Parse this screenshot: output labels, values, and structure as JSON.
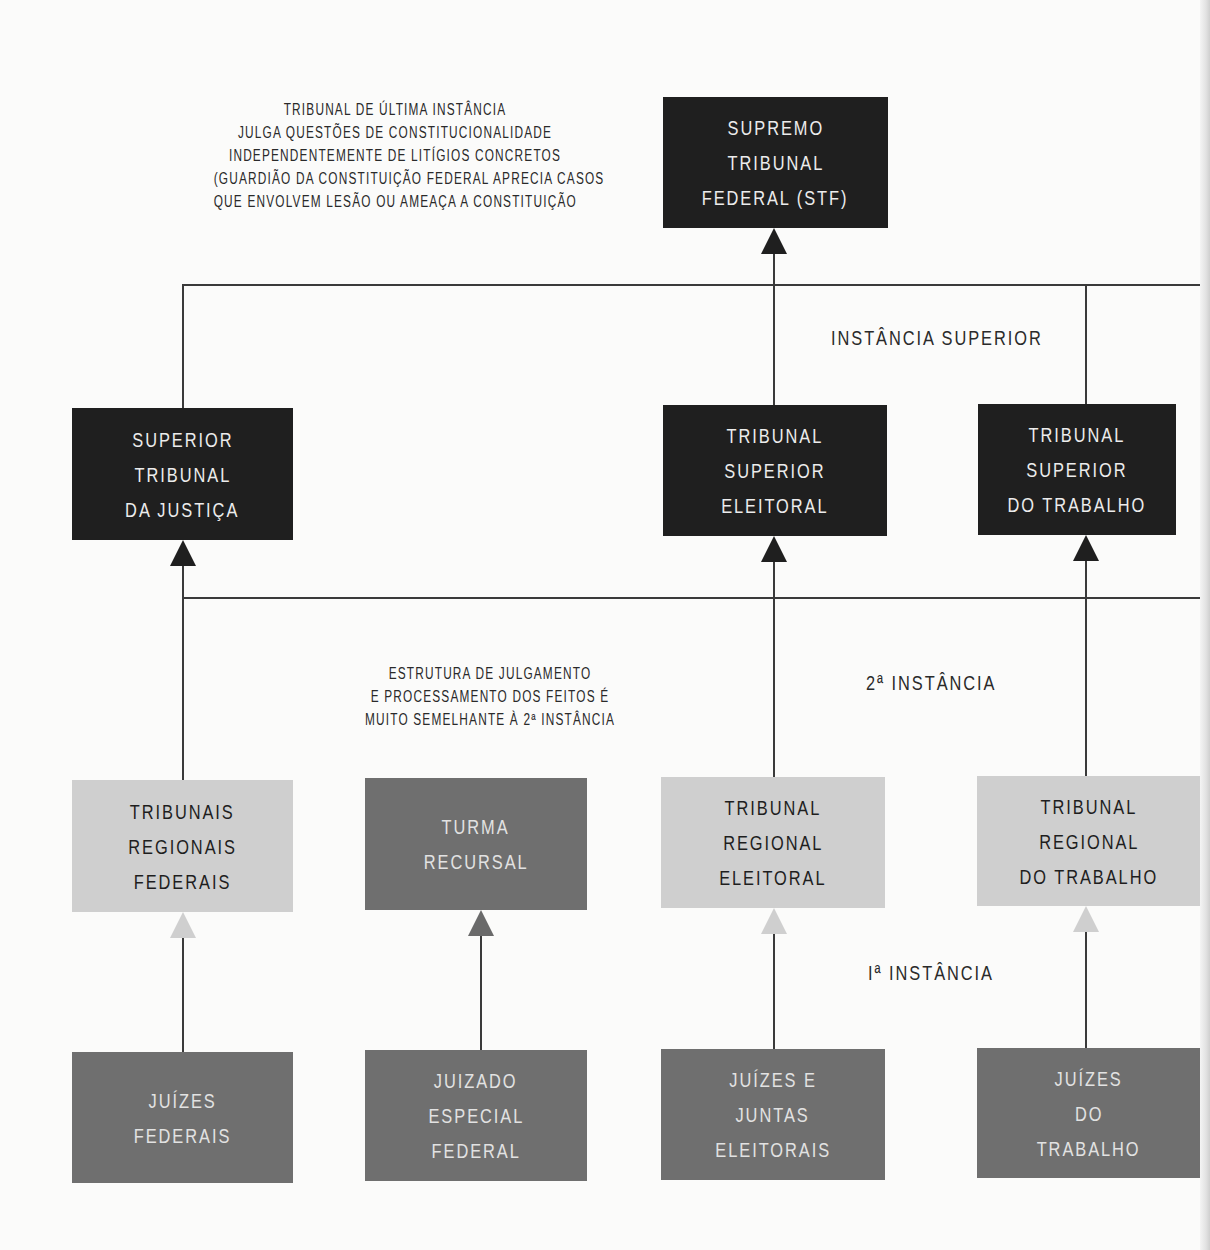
{
  "diagram": {
    "notes": {
      "stf_description": [
        "TRIBUNAL DE ÚLTIMA INSTÂNCIA",
        "JULGA QUESTÕES DE CONSTITUCIONALIDADE",
        "INDEPENDENTEMENTE DE LITÍGIOS CONCRETOS",
        "(GUARDIÃO DA CONSTITUIÇÃO FEDERAL APRECIA CASOS",
        "QUE ENVOLVEM LESÃO OU AMEAÇA A CONSTITUIÇÃO"
      ],
      "turma_recursal_description": [
        "ESTRUTURA DE JULGAMENTO",
        "E PROCESSAMENTO DOS FEITOS É",
        "MUITO SEMELHANTE À 2ª INSTÂNCIA"
      ]
    },
    "levels": {
      "superior": "INSTÂNCIA SUPERIOR",
      "second": "2ª INSTÂNCIA",
      "first": "Iª INSTÂNCIA"
    },
    "nodes": {
      "stf": [
        "SUPREMO",
        "TRIBUNAL",
        "FEDERAL (STF)"
      ],
      "stj": [
        "SUPERIOR",
        "TRIBUNAL",
        "DA JUSTIÇA"
      ],
      "tse": [
        "TRIBUNAL",
        "SUPERIOR",
        "ELEITORAL"
      ],
      "tst": [
        "TRIBUNAL",
        "SUPERIOR",
        "DO TRABALHO"
      ],
      "trf": [
        "TRIBUNAIS",
        "REGIONAIS",
        "FEDERAIS"
      ],
      "turma_recursal": [
        "TURMA",
        "RECURSAL"
      ],
      "tre": [
        "TRIBUNAL",
        "REGIONAL",
        "ELEITORAL"
      ],
      "trt": [
        "TRIBUNAL",
        "REGIONAL",
        "DO TRABALHO"
      ],
      "juizes_federais": [
        "JUÍZES",
        "FEDERAIS"
      ],
      "juizado_especial_federal": [
        "JUIZADO",
        "ESPECIAL",
        "FEDERAL"
      ],
      "juizes_juntas_eleitorais": [
        "JUÍZES E",
        "JUNTAS",
        "ELEITORAIS"
      ],
      "juizes_trabalho": [
        "JUÍZES",
        "DO",
        "TRABALHO"
      ]
    },
    "colors": {
      "dark_box": "#1f1f1f",
      "medium_box": "#6f6f6f",
      "light_box": "#cfcfcf",
      "line": "#3a3a3a",
      "background": "#fbfbfa"
    }
  }
}
